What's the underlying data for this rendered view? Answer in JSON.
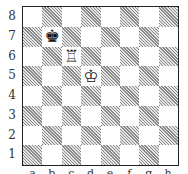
{
  "board": {
    "ranks": [
      "8",
      "7",
      "6",
      "5",
      "4",
      "3",
      "2",
      "1"
    ],
    "files": [
      "a",
      "b",
      "c",
      "d",
      "e",
      "f",
      "g",
      "h"
    ],
    "pieces": {
      "b7": {
        "glyph": "♚",
        "name": "black-king",
        "color": "black"
      },
      "c6": {
        "glyph": "♖",
        "name": "white-rook",
        "color": "white"
      },
      "d5": {
        "glyph": "♔",
        "name": "white-king",
        "color": "white"
      }
    },
    "colors": {
      "light": "#ffffff",
      "dark": "#a8a8a8",
      "border": "#222222"
    }
  }
}
